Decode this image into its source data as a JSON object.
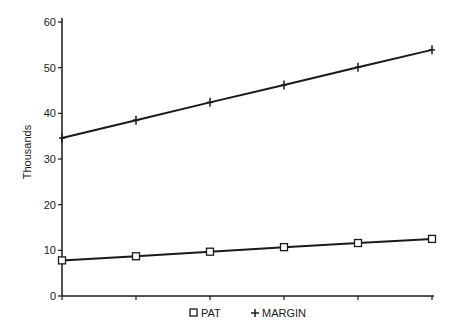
{
  "chart_data": {
    "type": "line",
    "title": "",
    "xlabel": "",
    "ylabel": "Thousands",
    "ylim": [
      0,
      60
    ],
    "yticks": [
      0,
      10,
      20,
      30,
      40,
      50,
      60
    ],
    "x": [
      1,
      2,
      3,
      4,
      5,
      6
    ],
    "categories": [
      "",
      "",
      "",
      "",
      "",
      ""
    ],
    "grid": false,
    "legend_position": "bottom",
    "series": [
      {
        "name": "PAT",
        "marker": "square",
        "values": [
          7.8,
          8.7,
          9.7,
          10.7,
          11.6,
          12.5
        ]
      },
      {
        "name": "MARGIN",
        "marker": "plus",
        "values": [
          34.6,
          38.5,
          42.4,
          46.2,
          50.1,
          53.9
        ]
      }
    ]
  },
  "legend": {
    "items": [
      {
        "label": "PAT",
        "symbol": "□"
      },
      {
        "label": "MARGIN",
        "symbol": "+"
      }
    ]
  },
  "colors": {
    "line": "#1a1a1a",
    "background": "#ffffff"
  }
}
